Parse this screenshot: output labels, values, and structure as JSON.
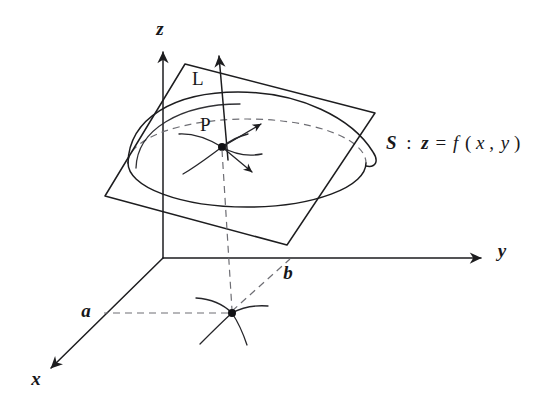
{
  "figure": {
    "kind": "3d-math-diagram",
    "background_color": "#ffffff",
    "ink_color": "#1d1d1f",
    "dashed_color": "#6e6e74"
  },
  "axes": {
    "z": {
      "label": "z",
      "x": 160,
      "y": 35
    },
    "y": {
      "label": "y",
      "x": 502,
      "y": 257
    },
    "x": {
      "label": "x",
      "x": 36,
      "y": 385
    }
  },
  "labels": {
    "tangent_plane_line": {
      "text": "L",
      "x": 192,
      "y": 85
    },
    "point_p": {
      "text": "P",
      "x": 206,
      "y": 128
    },
    "param_a": {
      "text": "a",
      "x": 86,
      "y": 316
    },
    "param_b": {
      "text": "b",
      "x": 288,
      "y": 277
    }
  },
  "surface_equation": {
    "name": "S",
    "colon": ":",
    "lhs": "z",
    "equals": "=",
    "rhs": "f",
    "open_paren": "(",
    "var1": "x",
    "comma": ",",
    "var2": "y",
    "close_paren": ")",
    "full_text": "S : z = f(x, y)",
    "x": 390,
    "y": 142
  },
  "geometry": {
    "origin": {
      "x": 163,
      "y": 258
    },
    "point_p": {
      "x": 222,
      "y": 145
    },
    "point_ab": {
      "x": 232,
      "y": 313
    },
    "normal_arrow_tip": {
      "x": 218,
      "y": 46
    },
    "plane_corners": [
      {
        "x": 185,
        "y": 64
      },
      {
        "x": 375,
        "y": 113
      },
      {
        "x": 287,
        "y": 245
      },
      {
        "x": 105,
        "y": 196
      }
    ]
  }
}
